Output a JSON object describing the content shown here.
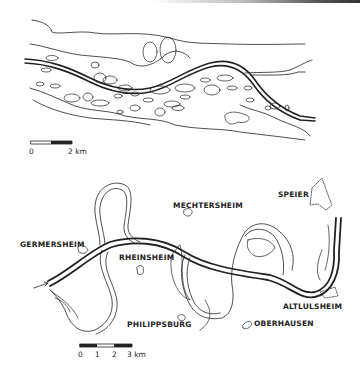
{
  "figure": {
    "top_map": {
      "description": "Braided river reach",
      "scale_bar": {
        "start_label": "0",
        "end_label": "2 km"
      }
    },
    "bottom_map": {
      "description": "Meandering Rhine reach with cut-off meanders",
      "places": [
        {
          "name": "SPEIER"
        },
        {
          "name": "MECHTERSHEIM"
        },
        {
          "name": "GERMERSHEIM"
        },
        {
          "name": "RHEINSHEIM"
        },
        {
          "name": "PHILIPPSBURG"
        },
        {
          "name": "OBERHAUSEN"
        },
        {
          "name": "ALTLULSHEIM"
        }
      ],
      "scale_bar": {
        "ticks": [
          "0",
          "1",
          "2",
          "3 km"
        ]
      }
    },
    "colors": {
      "ink": "#222222",
      "background": "#ffffff"
    }
  }
}
